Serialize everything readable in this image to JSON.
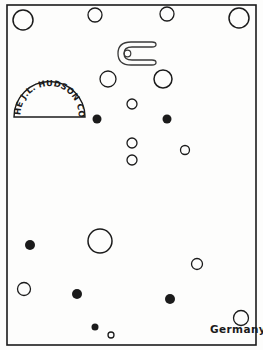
{
  "artwork": {
    "title": "Card of buttons line drawing",
    "background_color": "#fdfdfc",
    "ink_color": "#1b1b1b",
    "frame": {
      "x": 7,
      "y": 5,
      "width": 249,
      "height": 340,
      "stroke": 1.6
    }
  },
  "maker_mark": {
    "shape": "semicircle-stamp",
    "text": "THE J.L. HUDSON CO.",
    "center_x": 49.5,
    "baseline_y": 117,
    "radius": 35.5
  },
  "country_mark": {
    "text": "Germany",
    "x": 210,
    "y": 323
  },
  "horseshoe": {
    "name": "horseshoe-outline",
    "x": 118,
    "y": 41,
    "width": 40,
    "height": 25,
    "eyelet": {
      "cx": 127,
      "cy": 53,
      "r": 3.2
    }
  },
  "circles": [
    {
      "id": "c01",
      "cx": 23,
      "cy": 20,
      "r": 10,
      "fill": "open"
    },
    {
      "id": "c02",
      "cx": 95,
      "cy": 15,
      "r": 7,
      "fill": "open"
    },
    {
      "id": "c03",
      "cx": 167,
      "cy": 14,
      "r": 7,
      "fill": "open"
    },
    {
      "id": "c04",
      "cx": 239,
      "cy": 18,
      "r": 10,
      "fill": "open"
    },
    {
      "id": "c05",
      "cx": 108,
      "cy": 79,
      "r": 8,
      "fill": "open"
    },
    {
      "id": "c06",
      "cx": 163,
      "cy": 79,
      "r": 9,
      "fill": "open"
    },
    {
      "id": "c07",
      "cx": 132,
      "cy": 104,
      "r": 5,
      "fill": "open"
    },
    {
      "id": "c08",
      "cx": 97,
      "cy": 119,
      "r": 4.5,
      "fill": "solid"
    },
    {
      "id": "c09",
      "cx": 167,
      "cy": 119,
      "r": 4.5,
      "fill": "solid"
    },
    {
      "id": "c10",
      "cx": 132,
      "cy": 143,
      "r": 5,
      "fill": "open"
    },
    {
      "id": "c11",
      "cx": 185,
      "cy": 150,
      "r": 4.5,
      "fill": "open"
    },
    {
      "id": "c12",
      "cx": 132,
      "cy": 160,
      "r": 5,
      "fill": "open"
    },
    {
      "id": "c13",
      "cx": 30,
      "cy": 245,
      "r": 5,
      "fill": "solid"
    },
    {
      "id": "c14",
      "cx": 100,
      "cy": 241,
      "r": 12,
      "fill": "open"
    },
    {
      "id": "c15",
      "cx": 197,
      "cy": 264,
      "r": 5.5,
      "fill": "open"
    },
    {
      "id": "c16",
      "cx": 77,
      "cy": 294,
      "r": 5,
      "fill": "solid"
    },
    {
      "id": "c17",
      "cx": 170,
      "cy": 299,
      "r": 5,
      "fill": "solid"
    },
    {
      "id": "c18",
      "cx": 24,
      "cy": 289,
      "r": 6.5,
      "fill": "open"
    },
    {
      "id": "c19",
      "cx": 95,
      "cy": 327,
      "r": 3.5,
      "fill": "solid"
    },
    {
      "id": "c20",
      "cx": 111,
      "cy": 335,
      "r": 3,
      "fill": "open"
    },
    {
      "id": "c21",
      "cx": 241,
      "cy": 318,
      "r": 7.5,
      "fill": "open"
    }
  ]
}
